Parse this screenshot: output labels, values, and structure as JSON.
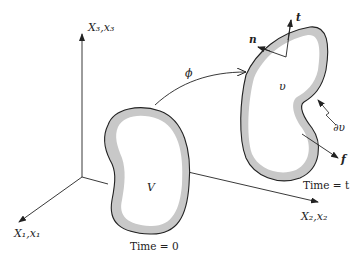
{
  "figure": {
    "axes": {
      "x3_label": "X₃,x₃",
      "x1_label": "X₁,x₁",
      "x2_label": "X₂,x₂"
    },
    "reference_body": {
      "volume_label": "V",
      "time_label": "Time = 0"
    },
    "current_body": {
      "volume_label": "υ",
      "boundary_label": "∂υ",
      "time_label": "Time = t",
      "normal_label": "n",
      "traction_label": "t",
      "body_force_label": "f"
    },
    "mapping": {
      "label": "ϕ"
    },
    "colors": {
      "stroke": "#222222",
      "shell_fill": "#c8c8c8",
      "interior_fill": "#ffffff"
    }
  }
}
